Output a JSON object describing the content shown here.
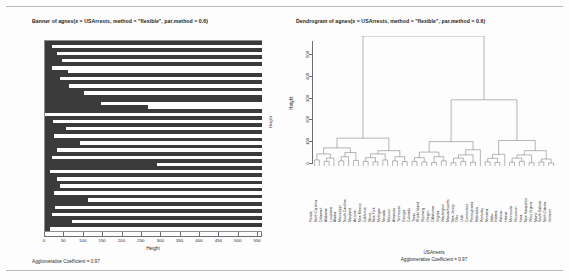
{
  "colors": {
    "bar": "#3b3b3b",
    "axis": "#6e6e72",
    "rule": "#b9b9bd",
    "background": "#fdfdfd",
    "text": "#1c1c1c"
  },
  "banner": {
    "title": "Banner of  agnes(x = USArrests, method = \"flexible\", par.method = 0.6)",
    "xlabel": "Height",
    "ylabel": "Height",
    "agglomerative_coefficient_label": "Agglomerative Coefficient =  0.97"
  },
  "dendrogram": {
    "title": "Dendrogram of  agnes(x = USArrests, method = \"flexible\", par.method = 0.6)",
    "ylabel": "Height",
    "footer_line1": "USArrests",
    "footer_line2": "Agglomerative Coefficient =  0.97"
  },
  "chart_data": [
    {
      "type": "bar",
      "title": "Banner of  agnes(x = USArrests, method = \"flexible\", par.method = 0.6)",
      "subtitle": "Agglomerative Coefficient =  0.97",
      "orientation": "horizontal",
      "xlabel": "Height",
      "ylabel": "Height",
      "xlim": [
        0,
        560
      ],
      "xticks": [
        0,
        50,
        100,
        150,
        200,
        250,
        300,
        350,
        400,
        450,
        500,
        550
      ],
      "xticklabels": [
        "0",
        "50",
        "100",
        "150",
        "200",
        "250",
        "300",
        "350",
        "400",
        "450",
        "500",
        "550"
      ],
      "grid": false,
      "bar_color": "#3b3b3b",
      "note": "Banner plot: each row is a merge step; the dark bar extends from 0 to the merge height, white space shows remaining distance to 560.",
      "values": [
        560,
        18,
        560,
        32,
        560,
        45,
        560,
        18,
        60,
        560,
        38,
        560,
        62,
        560,
        100,
        560,
        560,
        145,
        265,
        560,
        0,
        560,
        20,
        560,
        55,
        560,
        22,
        560,
        90,
        560,
        30,
        560,
        18,
        560,
        290,
        560,
        14,
        560,
        30,
        560,
        38,
        560,
        22,
        560,
        110,
        560,
        25,
        560,
        18,
        560,
        70,
        560,
        14
      ]
    },
    {
      "type": "dendrogram",
      "title": "Dendrogram of  agnes(x = USArrests, method = \"flexible\", par.method = 0.6)",
      "subtitle": "USArrests",
      "subtitle2": "Agglomerative Coefficient =  0.97",
      "ylabel": "Height",
      "ylim": [
        0,
        560
      ],
      "yticks": [
        0,
        100,
        200,
        300,
        400,
        500
      ],
      "yticklabels": [
        "0",
        "100",
        "200",
        "300",
        "400",
        "500"
      ],
      "grid": false,
      "line_color": "#6e6e72",
      "n_leaves": 50,
      "leaves": [
        "Florida",
        "North Carolina",
        "Delaware",
        "Alabama",
        "Louisiana",
        "Alaska",
        "Mississippi",
        "South Carolina",
        "Maryland",
        "Arizona",
        "New Mexico",
        "California",
        "Illinois",
        "New York",
        "Michigan",
        "Nevada",
        "Missouri",
        "Arkansas",
        "Tennessee",
        "Georgia",
        "Colorado",
        "Texas",
        "Rhode Island",
        "Wyoming",
        "Oregon",
        "Oklahoma",
        "Virginia",
        "Washington",
        "Massachusetts",
        "New Jersey",
        "Ohio",
        "Utah",
        "Connecticut",
        "Pennsylvania",
        "Nebraska",
        "Kentucky",
        "Montana",
        "Idaho",
        "Indiana",
        "Kansas",
        "Hawaii",
        "Minnesota",
        "Wisconsin",
        "Iowa",
        "New Hampshire",
        "West Virginia",
        "Maine",
        "South Dakota",
        "North Dakota",
        "Vermont"
      ],
      "merges": [
        {
          "height": 560,
          "note": "root split: cluster A (left) vs clusters B+C (right)"
        },
        {
          "height": 285,
          "note": "second split: cluster B vs cluster C"
        },
        {
          "height": 120,
          "note": "cluster A internal"
        },
        {
          "height": 105,
          "note": "cluster B internal"
        },
        {
          "height": 110,
          "note": "cluster C internal"
        }
      ]
    }
  ]
}
